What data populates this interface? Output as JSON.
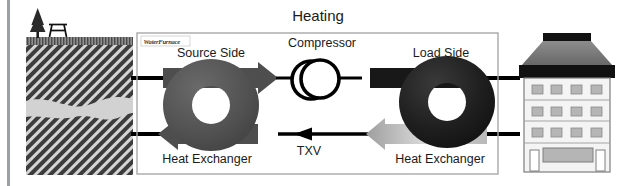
{
  "diagram": {
    "title": "Heating",
    "brand_logo": "WaterFurnace",
    "labels": {
      "source_side": "Source Side",
      "load_side": "Load Side",
      "compressor": "Compressor",
      "txv": "TXV",
      "heat_exchanger_left": "Heat Exchanger",
      "heat_exchanger_right": "Heat Exchanger"
    },
    "icons": {
      "tree": "pine-tree-icon",
      "picnic_table": "picnic-table-icon",
      "building": "building-icon",
      "compressor": "compressor-icon",
      "source_coil": "source-coil-icon",
      "load_coil": "load-coil-icon",
      "flow_arrow_source_supply": "arrow-right-icon",
      "flow_arrow_source_return": "arrow-left-icon",
      "flow_arrow_load_supply": "arrow-right-icon",
      "flow_arrow_load_return": "arrow-left-icon",
      "txv_arrow": "arrow-left-icon"
    },
    "colors": {
      "text": "#1a1a1a",
      "panel_border": "#a8a8a8",
      "ground_soil": "#3c3c3c",
      "ground_hatch": "#d9d9d9",
      "aquifer": "#d2d2d2",
      "turf": "#8c8c8c",
      "source_coil": "#4e4e4e",
      "load_coil": "#1c1c1c",
      "pipe": "#000000",
      "arrow_gray": "#4e4e4e",
      "arrow_gradient_light": "#d8d8d8",
      "building_roof": "#7d7d7d",
      "building_cap": "#111111",
      "building_wall": "#f2f2f2",
      "building_window": "#b5b5b5",
      "left_rule": "#9aa0a6"
    },
    "ground_section": {
      "description": "Subsurface cross-section with turf, hatched soil and wavy aquifer layer",
      "turf_label": "turf-band",
      "aquifer_label": "aquifer-band"
    },
    "building_section": {
      "description": "Multi-story commercial building served by the load side",
      "window_rows": 3,
      "windows_per_row": 4,
      "entrance": "entrance-awning"
    }
  }
}
